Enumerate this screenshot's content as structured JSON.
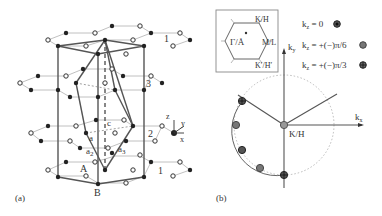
{
  "figure": {
    "panel_a": {
      "label": "(a)",
      "layer_labels": [
        "1",
        "3",
        "2",
        "1"
      ],
      "vectors": {
        "a1": "a",
        "a2": "a",
        "a3": "a",
        "a2_sub": "2",
        "a3_sub": "3",
        "c": "c"
      },
      "sites": {
        "A": "A",
        "B": "B"
      },
      "axes": {
        "z": "z",
        "y": "y",
        "x": "x"
      }
    },
    "panel_b": {
      "label": "(b)",
      "bz_inset": {
        "gamma": "Γ/Å",
        "k_h": "K/H",
        "m_l": "M/L",
        "kprime_hprime": "K′/H′"
      },
      "legend": [
        {
          "text": "k",
          "sub": "z",
          "rest": " = 0",
          "marker": "dark-dot"
        },
        {
          "text": "k",
          "sub": "z",
          "rest": " = +(−)π/6",
          "marker": "gray-dot"
        },
        {
          "text": "k",
          "sub": "z",
          "rest": " = +(−)π/3",
          "marker": "cross-dot"
        }
      ],
      "axes": {
        "kx": "k",
        "kx_sub": "x",
        "ky": "k",
        "ky_sub": "y"
      },
      "center_label": "K/H"
    },
    "colors": {
      "line": "#555555",
      "light_line": "#aaaaaa",
      "atom_dark": "#222222",
      "marker_gray": "#777777"
    }
  }
}
